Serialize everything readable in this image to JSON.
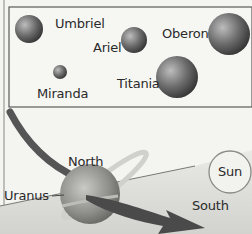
{
  "moons_panel": {
    "moons": [
      {
        "name": "Umbriel",
        "cx": 29,
        "cy": 29,
        "r": 14
      },
      {
        "name": "Ariel",
        "cx": 134,
        "cy": 40,
        "r": 13
      },
      {
        "name": "Oberon",
        "cx": 229,
        "cy": 34,
        "r": 21
      },
      {
        "name": "Miranda",
        "cx": 60,
        "cy": 72,
        "r": 7
      },
      {
        "name": "Titania",
        "cx": 177,
        "cy": 77,
        "r": 21
      }
    ]
  },
  "orbit_panel": {
    "planet_label": "Uranus",
    "north_label": "North",
    "south_label": "South",
    "sun_label": "Sun"
  },
  "colors": {
    "background": "#f4f4f1",
    "panel_border": "#5a5a5a",
    "moon_dark": "#3a3a3a",
    "moon_light": "#bdbdbd",
    "arrow": "#4a4a4a",
    "ground": "#dadad6"
  }
}
